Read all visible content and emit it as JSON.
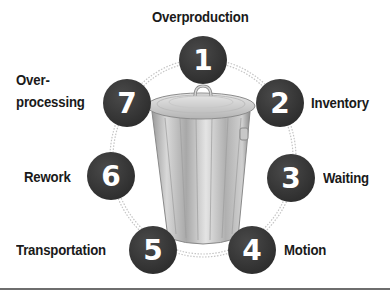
{
  "diagram": {
    "center_image": "trash-can",
    "items": [
      {
        "number": "1",
        "label": "Overproduction"
      },
      {
        "number": "2",
        "label": "Inventory"
      },
      {
        "number": "3",
        "label": "Waiting"
      },
      {
        "number": "4",
        "label": "Motion"
      },
      {
        "number": "5",
        "label": "Transportation"
      },
      {
        "number": "6",
        "label": "Rework"
      },
      {
        "number": "7",
        "label_line1": "Over-",
        "label_line2": "processing"
      }
    ],
    "colors": {
      "circle_fill": "#3a3a3a",
      "circle_text": "#ffffff",
      "label_text": "#1a1a1a",
      "dotted_ring": "#b8b8b8",
      "rule": "#6e6e6e"
    }
  }
}
